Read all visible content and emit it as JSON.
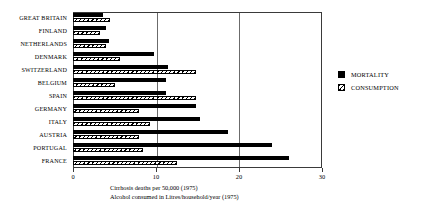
{
  "chart_data": {
    "type": "bar",
    "orientation": "horizontal",
    "title": "",
    "xlabel": "",
    "ylabel": "",
    "xlim": [
      0,
      30
    ],
    "xticks": [
      0,
      10,
      20,
      30
    ],
    "xtick_labels": [
      "0",
      "10",
      "20",
      "30"
    ],
    "grid": true,
    "legend_position": "right",
    "categories": [
      "GREAT BRITAIN",
      "FINLAND",
      "NETHERLANDS",
      "DENMARK",
      "SWITZERLAND",
      "BELGIUM",
      "SPAIN",
      "GERMANY",
      "ITALY",
      "AUSTRIA",
      "PORTUGAL",
      "FRANCE"
    ],
    "series": [
      {
        "name": "MORTALITY",
        "color": "#000000",
        "fill": "solid",
        "values": [
          3.6,
          4.0,
          4.3,
          9.8,
          11.5,
          11.2,
          11.2,
          14.8,
          15.3,
          18.7,
          24.0,
          26.0
        ]
      },
      {
        "name": "CONSUMPTION",
        "color": "#000000",
        "fill": "hatched",
        "values": [
          4.5,
          3.3,
          4.0,
          5.7,
          14.8,
          5.0,
          14.8,
          8.0,
          9.3,
          8.0,
          8.4,
          12.5
        ]
      }
    ],
    "annotations": [
      "Cirrhosis deaths per 50,000 (1975)",
      "Alcohol consumed in Litres/household/year (1975)"
    ]
  },
  "legend": {
    "items": [
      {
        "label": "MORTALITY",
        "marker": "solid-square-icon"
      },
      {
        "label": "CONSUMPTION",
        "marker": "hatched-square-icon"
      }
    ]
  },
  "captions": {
    "line1": "Cirrhosis deaths per 50,000 (1975)",
    "line2": "Alcohol consumed in Litres/household/year (1975)"
  }
}
